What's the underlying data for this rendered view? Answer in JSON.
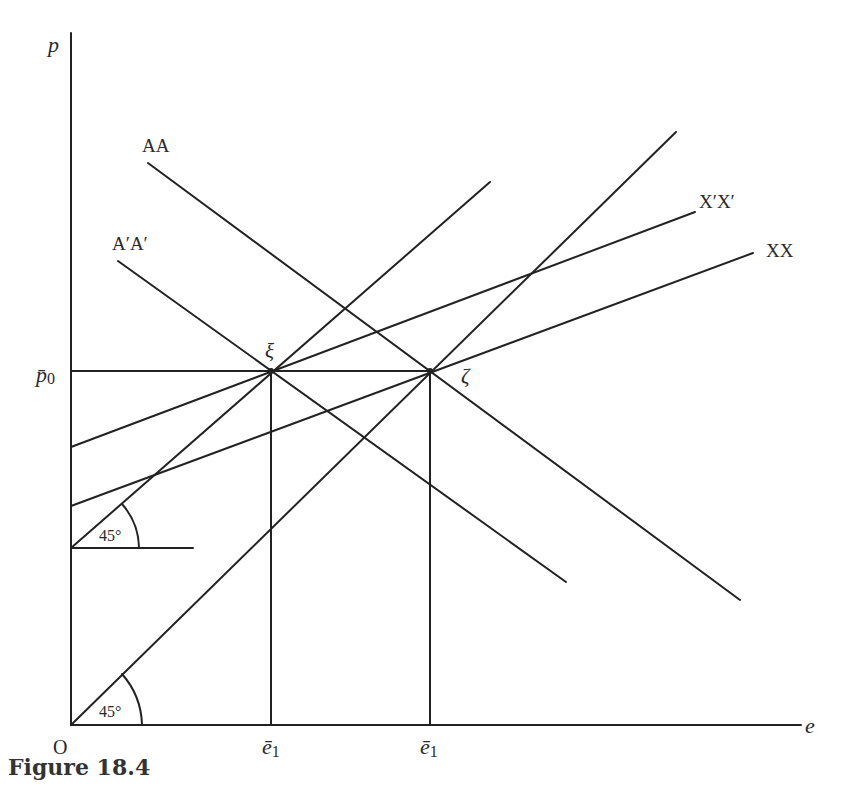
{
  "figure": {
    "caption": "Figure 18.4"
  },
  "axes": {
    "y_label": "p",
    "x_label": "e",
    "origin_label": "O",
    "y_tick_label": "p̄",
    "y_tick_sub": "0",
    "x_tick_labels": [
      {
        "base": "ē",
        "sub": "1"
      },
      {
        "base": "ē",
        "sub": "1"
      }
    ]
  },
  "curves": {
    "aa": "AA",
    "apap": "A′A′",
    "xpxp": "X′X′",
    "xx": "XX"
  },
  "points": {
    "xi": "ξ",
    "zeta": "ζ"
  },
  "angles": {
    "upper": "45°",
    "lower": "45°"
  },
  "colors": {
    "line": "#222222",
    "text": "#2a2a2a"
  }
}
